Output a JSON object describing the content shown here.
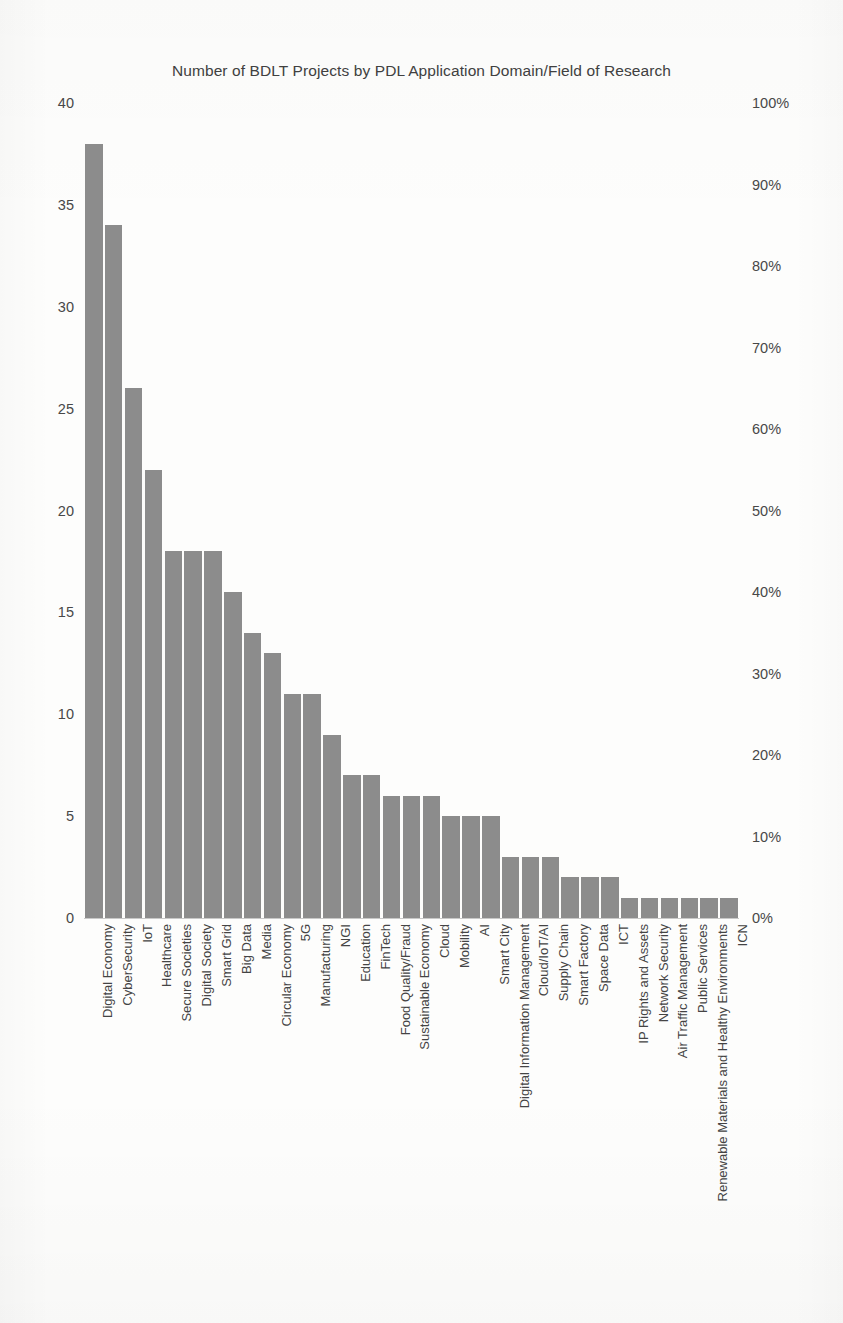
{
  "chart_data": {
    "type": "bar",
    "title": "Number of BDLT Projects by PDL Application Domain/Field of Research",
    "xlabel": "",
    "ylabel": "",
    "ylim": [
      0,
      40
    ],
    "y_ticks": [
      "0",
      "5",
      "10",
      "15",
      "20",
      "25",
      "30",
      "35",
      "40"
    ],
    "y_tick_values": [
      0,
      5,
      10,
      15,
      20,
      25,
      30,
      35,
      40
    ],
    "secondary_axis": {
      "position": "right",
      "ylim": [
        0,
        100
      ],
      "unit": "%",
      "ticks": [
        "0%",
        "10%",
        "20%",
        "30%",
        "40%",
        "50%",
        "60%",
        "70%",
        "80%",
        "90%",
        "100%"
      ],
      "tick_values": [
        0,
        10,
        20,
        30,
        40,
        50,
        60,
        70,
        80,
        90,
        100
      ]
    },
    "grid": false,
    "legend": "none",
    "bar_color": "#8c8c8c",
    "categories": [
      "Digital Economy",
      "CyberSecurity",
      "IoT",
      "Healthcare",
      "Secure Societies",
      "Digital Society",
      "Smart Grid",
      "Big Data",
      "Media",
      "Circular Economy",
      "5G",
      "Manufacturing",
      "NGI",
      "Education",
      "FinTech",
      "Food Quality/Fraud",
      "Sustainable Economy",
      "Cloud",
      "Mobility",
      "AI",
      "Smart City",
      "Digital Information Management",
      "Cloud/IoT/AI",
      "Supply Chain",
      "Smart Factory",
      "Space Data",
      "ICT",
      "IP Rights and Assets",
      "Network Security",
      "Air Traffic Management",
      "Public Services",
      "Renewable Materials and Healthy Environments",
      "ICN"
    ],
    "values": [
      38,
      34,
      26,
      22,
      18,
      18,
      18,
      16,
      14,
      13,
      11,
      11,
      9,
      7,
      7,
      6,
      6,
      6,
      5,
      5,
      5,
      3,
      3,
      3,
      2,
      2,
      2,
      1,
      1,
      1,
      1,
      1,
      1
    ]
  }
}
